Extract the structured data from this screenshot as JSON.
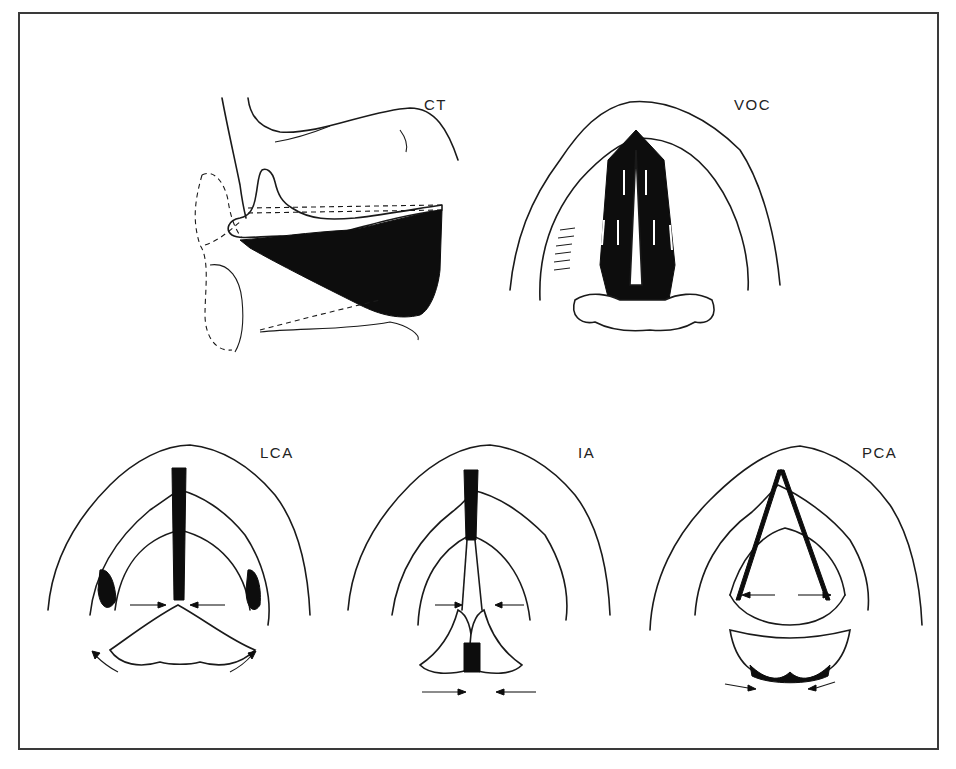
{
  "figure": {
    "panels": [
      {
        "id": "ct",
        "label": "CT",
        "view": "lateral",
        "arrows": "none"
      },
      {
        "id": "voc",
        "label": "VOC",
        "view": "superior",
        "arrows": "internal-white-arrows-anterior"
      },
      {
        "id": "lca",
        "label": "LCA",
        "view": "superior",
        "arrows": "adduction-medial-arrows, rotation-arrows"
      },
      {
        "id": "ia",
        "label": "IA",
        "view": "superior",
        "arrows": "adduction-medial-arrows, sliding-arrows"
      },
      {
        "id": "pca",
        "label": "PCA",
        "view": "superior",
        "arrows": "abduction-lateral-arrows, rotation-arrows"
      }
    ]
  },
  "colors": {
    "ink": "#1a1a1a",
    "background": "#ffffff",
    "frame": "#3a3a3a"
  }
}
